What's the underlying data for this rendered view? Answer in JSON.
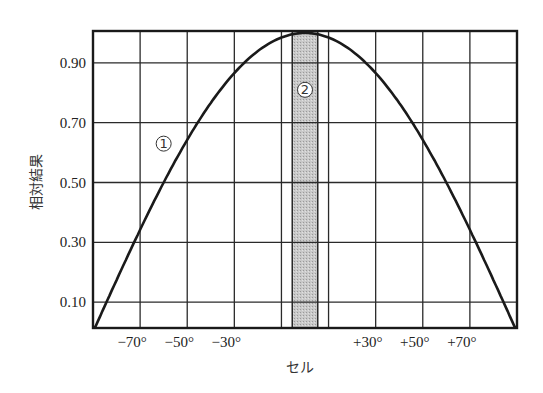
{
  "chart_data": {
    "type": "line",
    "title": "",
    "xlabel": "セル",
    "ylabel": "相対結果",
    "x_tick_labels": [
      "−70°",
      "−50°",
      "−30°",
      "+30°",
      "+50°",
      "+70°"
    ],
    "x_ticks_deg": [
      -70,
      -50,
      -30,
      30,
      50,
      70
    ],
    "y_tick_labels": [
      "0.90",
      "0.70",
      "0.50",
      "0.30",
      "0.10"
    ],
    "y_ticks": [
      0.9,
      0.7,
      0.5,
      0.3,
      0.1
    ],
    "xlim": [
      -90,
      90
    ],
    "ylim": [
      0.0,
      1.0
    ],
    "grid": true,
    "grid_x_deg": [
      -70,
      -50,
      -30,
      -10,
      10,
      30,
      50,
      70
    ],
    "series": [
      {
        "name": "①",
        "description": "relative result curve (cosine-like)",
        "x": [
          -90,
          -80,
          -70,
          -60,
          -50,
          -40,
          -30,
          -20,
          -10,
          0,
          10,
          20,
          30,
          40,
          50,
          60,
          70,
          80,
          90
        ],
        "y": [
          0.0,
          0.17,
          0.34,
          0.5,
          0.64,
          0.77,
          0.87,
          0.94,
          0.98,
          1.0,
          0.98,
          0.94,
          0.87,
          0.77,
          0.64,
          0.5,
          0.34,
          0.17,
          0.0
        ]
      }
    ],
    "shaded_band": {
      "name": "②",
      "x_range_deg": [
        -5,
        5
      ],
      "color": "#bdbdbd"
    },
    "annotations": [
      {
        "text": "①",
        "x_deg": -60,
        "y": 0.63
      },
      {
        "text": "②",
        "x_deg": 0,
        "y": 0.81
      }
    ]
  }
}
